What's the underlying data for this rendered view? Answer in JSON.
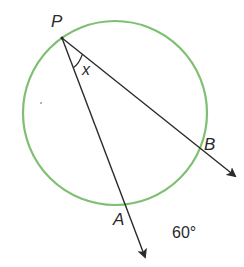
{
  "diagram": {
    "colors": {
      "circle": "#7fbf72",
      "lines": "#2a2a2a",
      "text": "#2a2a2a",
      "background": "#ffffff"
    },
    "circle": {
      "cx": 115,
      "cy": 113,
      "r": 92
    },
    "points": {
      "P": {
        "label": "P",
        "x": 62,
        "y": 38
      },
      "A": {
        "label": "A",
        "x": 126,
        "y": 205
      },
      "B": {
        "label": "B",
        "x": 197,
        "y": 152
      }
    },
    "angle_label": "x",
    "arc_label": "60°",
    "rays": [
      {
        "from": "P",
        "through": "A",
        "end": {
          "x": 145,
          "y": 258
        }
      },
      {
        "from": "P",
        "through": "B",
        "end": {
          "x": 236,
          "y": 176
        }
      }
    ]
  }
}
